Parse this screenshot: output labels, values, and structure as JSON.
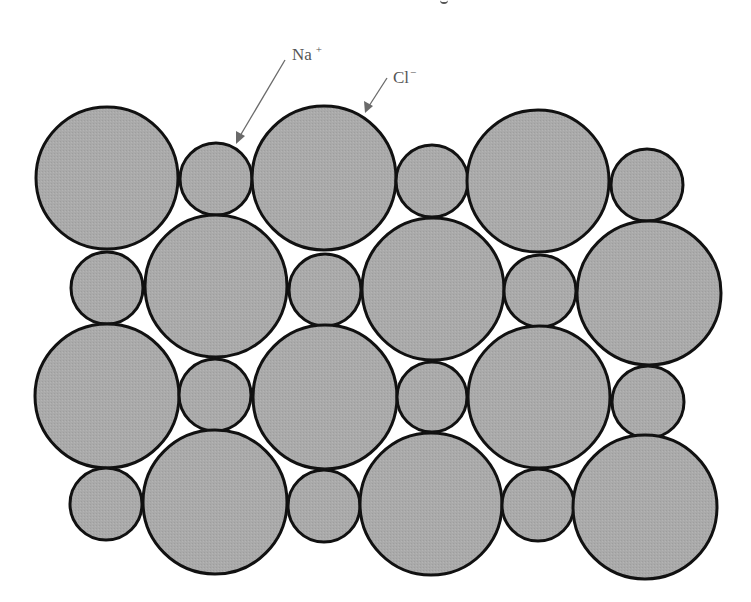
{
  "figure": {
    "type": "crystal-lattice-cross-section",
    "fill_color": "#a9a9a9",
    "stroke_color": "#111111",
    "background": "#ffffff"
  },
  "labels": {
    "sodium": {
      "base": "Na",
      "charge": "+"
    },
    "chloride": {
      "base": "Cl",
      "charge": "−"
    }
  },
  "ions": {
    "chloride_radius": 71,
    "sodium_radius": 36,
    "rows": [
      {
        "row": 1,
        "sequence": [
          "Cl",
          "Na",
          "Cl",
          "Na",
          "Cl",
          "Na"
        ]
      },
      {
        "row": 2,
        "sequence": [
          "Na",
          "Cl",
          "Na",
          "Cl",
          "Na",
          "Cl"
        ]
      },
      {
        "row": 3,
        "sequence": [
          "Cl",
          "Na",
          "Cl",
          "Na",
          "Cl",
          "Na"
        ]
      },
      {
        "row": 4,
        "sequence": [
          "Na",
          "Cl",
          "Na",
          "Cl",
          "Na",
          "Cl"
        ]
      }
    ],
    "count": {
      "Cl": 12,
      "Na": 12
    }
  }
}
